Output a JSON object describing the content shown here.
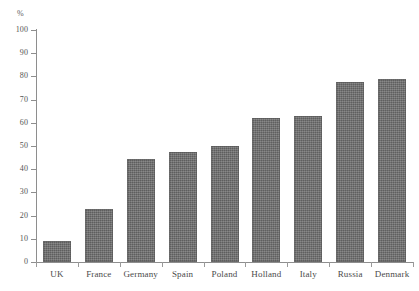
{
  "chart_data": {
    "type": "bar",
    "title": "",
    "xlabel": "",
    "ylabel": "%",
    "ylim": [
      0,
      100
    ],
    "grid": false,
    "legend": null,
    "categories": [
      "UK",
      "France",
      "Germany",
      "Spain",
      "Poland",
      "Holland",
      "Italy",
      "Russia",
      "Denmark"
    ],
    "values": [
      9,
      23,
      44.5,
      47.5,
      50,
      62,
      63,
      77.5,
      79
    ],
    "y_ticks": [
      0,
      10,
      20,
      30,
      40,
      50,
      60,
      70,
      80,
      90,
      100
    ],
    "y_tick_labels": [
      "0",
      "10",
      "20",
      "30",
      "40",
      "50",
      "60",
      "70",
      "80",
      "90",
      "100"
    ],
    "bar_color": "#6e6e6e",
    "background_color": "#ffffff",
    "axis_color": "#8e8e8e"
  },
  "axis": {
    "unit_label": "%"
  }
}
